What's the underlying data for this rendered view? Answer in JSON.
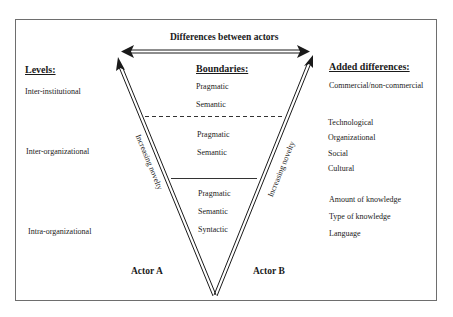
{
  "diagram": {
    "title": "Differences between actors",
    "levels": {
      "heading": "Levels:",
      "items": [
        "Inter-institutional",
        "Inter-organizational",
        "Intra-organizational"
      ]
    },
    "boundaries": {
      "heading": "Boundaries:",
      "groups": [
        [
          "Pragmatic",
          "Semantic"
        ],
        [
          "Pragmatic",
          "Semantic"
        ],
        [
          "Pragmatic",
          "Semantic",
          "Syntactic"
        ]
      ]
    },
    "added_differences": {
      "heading": "Added differences:",
      "groups": [
        [
          "Commercial/non-commercial"
        ],
        [
          "Technological",
          "Organizational",
          "Social",
          "Cultural"
        ],
        [
          "Amount of knowledge",
          "Type of knowledge",
          "Language"
        ]
      ]
    },
    "arrows": {
      "left_label": "Increasing novelty",
      "right_label": "Increasing novelty"
    },
    "actors": {
      "a": "Actor A",
      "b": "Actor B"
    },
    "colors": {
      "line": "#1a1a1a",
      "frame": "#6e6e6e",
      "background": "#ffffff"
    }
  }
}
